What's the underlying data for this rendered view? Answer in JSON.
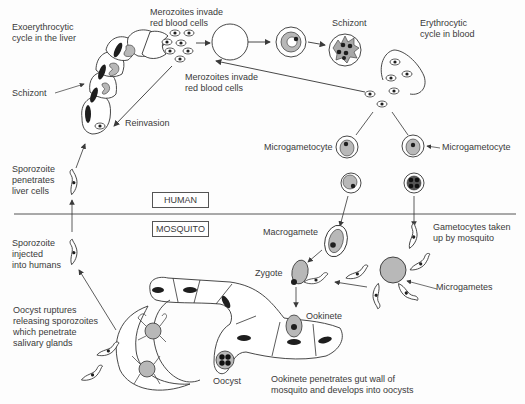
{
  "diagram": {
    "regions": {
      "human": "HUMAN",
      "mosquito": "MOSQUITO"
    },
    "labels": {
      "exoerythrocytic": "Exoerythrocytic\ncycle in the liver",
      "merozoites_top": "Merozoites invade\nred blood cells",
      "schizont_blood": "Schizont",
      "erythrocytic": "Erythrocytic\ncycle in blood",
      "merozoites_mid": "Merozoites invade\nred blood cells",
      "schizont_liver": "Schizont",
      "reinvasion": "Reinvasion",
      "sporozoite_penetrates": "Sporozoite\npenetrates\nliver cells",
      "microgametocyte_left": "Microgametocyte",
      "microgametocyte_right": "Microgametocyte",
      "sporozoite_injected": "Sporozoite\ninjected\ninto humans",
      "macrogamete": "Macrogamete",
      "gametocytes_taken": "Gametocytes taken\nup by mosquito",
      "zygote": "Zygote",
      "microgametes": "Microgametes",
      "ookinete": "Ookinete",
      "oocyst_ruptures": "Oocyst ruptures\nreleasing sporozoites\nwhich penetrate\nsalivary glands",
      "oocyst": "Oocyst",
      "ookinete_penetrates": "Ookinete penetrates gut wall of\nmosquito and develops into oocysts"
    },
    "colors": {
      "line": "#3a3a3a",
      "fill_gray": "#b8b8b8",
      "nucleus": "#1e1e1e"
    }
  }
}
